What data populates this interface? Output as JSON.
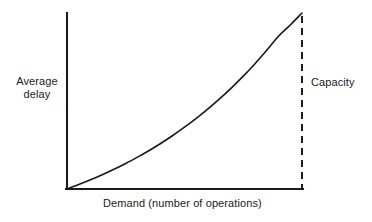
{
  "chart_data": {
    "type": "line",
    "title": "",
    "subtitle": "",
    "xlabel": "Demand (number of operations)",
    "ylabel": "Average delay",
    "ylabel_lines": [
      "Average",
      "delay"
    ],
    "annotations": [
      {
        "name": "capacity",
        "label": "Capacity",
        "style": "dashed-vertical-line",
        "x": 1.0
      }
    ],
    "legend": [],
    "legend_position": "none",
    "grid": false,
    "xlim": [
      0,
      1
    ],
    "ylim": [
      0,
      1
    ],
    "axis_ticks": {
      "x": [],
      "y": []
    },
    "series": [
      {
        "name": "Average delay vs demand",
        "color": "#181818",
        "style": "solid",
        "x": [
          0.0,
          0.05,
          0.1,
          0.15,
          0.2,
          0.25,
          0.3,
          0.35,
          0.4,
          0.45,
          0.5,
          0.55,
          0.6,
          0.65,
          0.7,
          0.75,
          0.8,
          0.85,
          0.9,
          0.95,
          1.0
        ],
        "y": [
          0.0,
          0.025,
          0.052,
          0.081,
          0.112,
          0.145,
          0.181,
          0.219,
          0.26,
          0.304,
          0.351,
          0.401,
          0.455,
          0.513,
          0.575,
          0.641,
          0.712,
          0.788,
          0.868,
          0.932,
          1.0
        ]
      }
    ],
    "colors": {
      "axis": "#1c1c1c",
      "curve": "#181818",
      "capacity": "#1c1c1c",
      "background": "#ffffff",
      "text": "#1a1a1a"
    },
    "geometry": {
      "origin_x": 67,
      "origin_y": 189,
      "plot_right": 302,
      "plot_top": 13
    }
  }
}
